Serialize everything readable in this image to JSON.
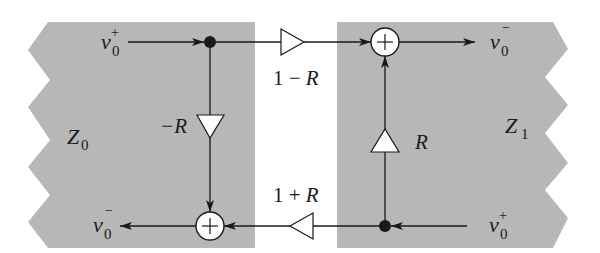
{
  "diagram": {
    "type": "signal-flow scattering junction",
    "colors": {
      "panel": "#b9b9b9",
      "line": "#1a1a1a",
      "background": "#ffffff",
      "node_fill": "#ffffff"
    },
    "left_section": {
      "impedance": {
        "base": "Z",
        "sub": "0"
      },
      "input_wave": {
        "base": "v",
        "sub": "0",
        "sup": "+"
      },
      "output_wave": {
        "base": "v",
        "sub": "0",
        "sup": "−"
      },
      "gain_label": "−R"
    },
    "right_section": {
      "impedance": {
        "base": "Z",
        "sub": "1"
      },
      "input_wave": {
        "base": "v",
        "sub": "0",
        "sup": "+"
      },
      "output_wave": {
        "base": "v",
        "sub": "0",
        "sup": "−"
      },
      "gain_label": "R"
    },
    "transmission": {
      "top_gain": {
        "prefix": "1 − ",
        "var": "R"
      },
      "bottom_gain": {
        "prefix": "1 + ",
        "var": "R"
      }
    },
    "sum_symbol": "+"
  }
}
